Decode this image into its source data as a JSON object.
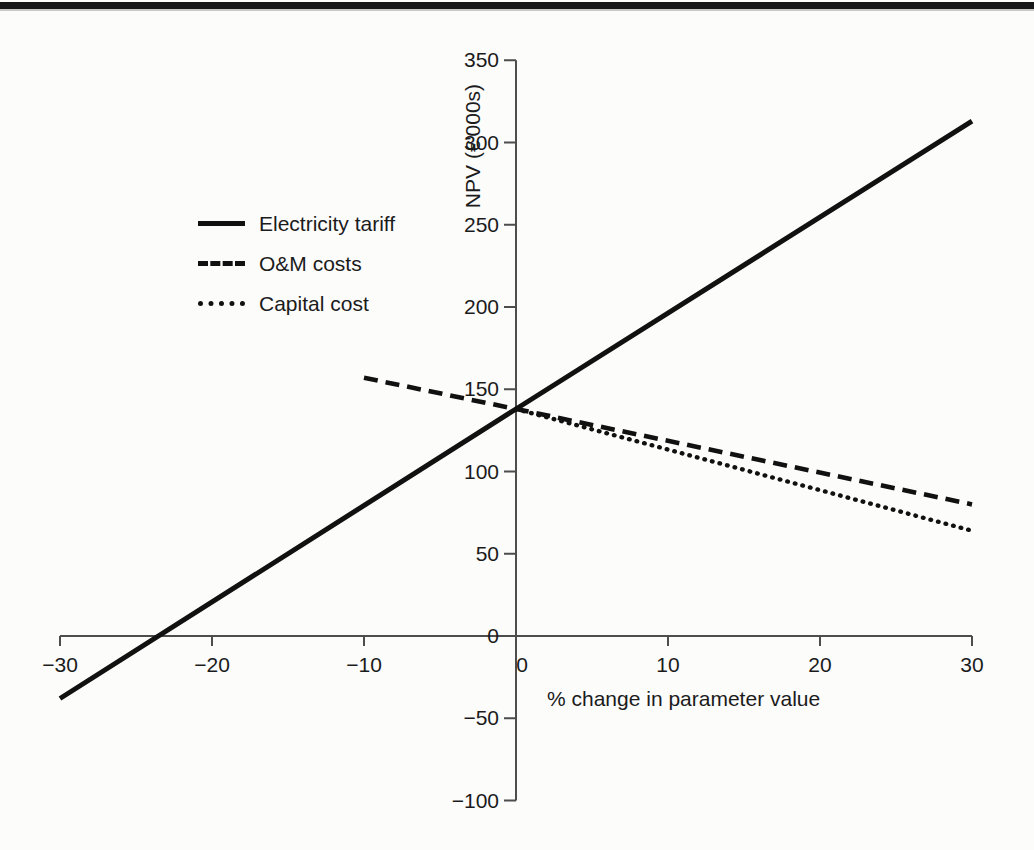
{
  "page": {
    "background": "#fcfcfb",
    "top_rule_color": "#171717",
    "axis_color": "#4d4d4d",
    "text_color": "#1b1b1b"
  },
  "chart_data": {
    "type": "line",
    "title": "",
    "xlabel": "% change in parameter value",
    "ylabel": "NPV (€'000s)",
    "xlim": [
      -30,
      30
    ],
    "ylim": [
      -100,
      350
    ],
    "xticks": [
      -30,
      -20,
      -10,
      0,
      10,
      20,
      30
    ],
    "yticks": [
      350,
      300,
      250,
      200,
      150,
      100,
      50,
      0,
      -50,
      -100
    ],
    "grid": false,
    "legend_position": "upper-left-inside",
    "base_case_npv": 138,
    "series": [
      {
        "name": "Electricity tariff",
        "style": "solid",
        "color": "#111111",
        "points": [
          [
            -30,
            -38
          ],
          [
            0,
            138
          ],
          [
            30,
            313
          ]
        ]
      },
      {
        "name": "O&M costs",
        "style": "dashed",
        "color": "#111111",
        "points": [
          [
            -10,
            157
          ],
          [
            0,
            138
          ],
          [
            30,
            80
          ]
        ]
      },
      {
        "name": "Capital cost",
        "style": "dotted",
        "color": "#111111",
        "points": [
          [
            0,
            138
          ],
          [
            30,
            64
          ]
        ]
      }
    ]
  }
}
